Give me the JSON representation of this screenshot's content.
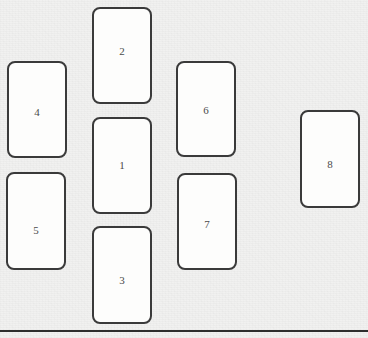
{
  "scene": {
    "width": 368,
    "height": 338,
    "background_color": "#f1f1f0",
    "card_fill_color": "#fdfdfc",
    "card_border_color": "#3a3a3a",
    "label_color": "#4a4a4a",
    "rule_color": "#2e2e2e"
  },
  "baseline_rule": {
    "y": 330,
    "height": 2,
    "label": "horizontal-rule"
  },
  "cards": [
    {
      "label": "2",
      "x": 92,
      "y": 7,
      "width": 60,
      "height": 97,
      "label_offset_y": -4
    },
    {
      "label": "1",
      "x": 92,
      "y": 117,
      "width": 60,
      "height": 97,
      "label_offset_y": 0
    },
    {
      "label": "3",
      "x": 92,
      "y": 226,
      "width": 60,
      "height": 98,
      "label_offset_y": 5
    },
    {
      "label": "4",
      "x": 7,
      "y": 61,
      "width": 60,
      "height": 97,
      "label_offset_y": 3
    },
    {
      "label": "5",
      "x": 6,
      "y": 172,
      "width": 60,
      "height": 98,
      "label_offset_y": 9
    },
    {
      "label": "6",
      "x": 176,
      "y": 61,
      "width": 60,
      "height": 96,
      "label_offset_y": 1
    },
    {
      "label": "7",
      "x": 177,
      "y": 173,
      "width": 60,
      "height": 97,
      "label_offset_y": 3
    },
    {
      "label": "8",
      "x": 300,
      "y": 110,
      "width": 60,
      "height": 98,
      "label_offset_y": 5
    }
  ]
}
